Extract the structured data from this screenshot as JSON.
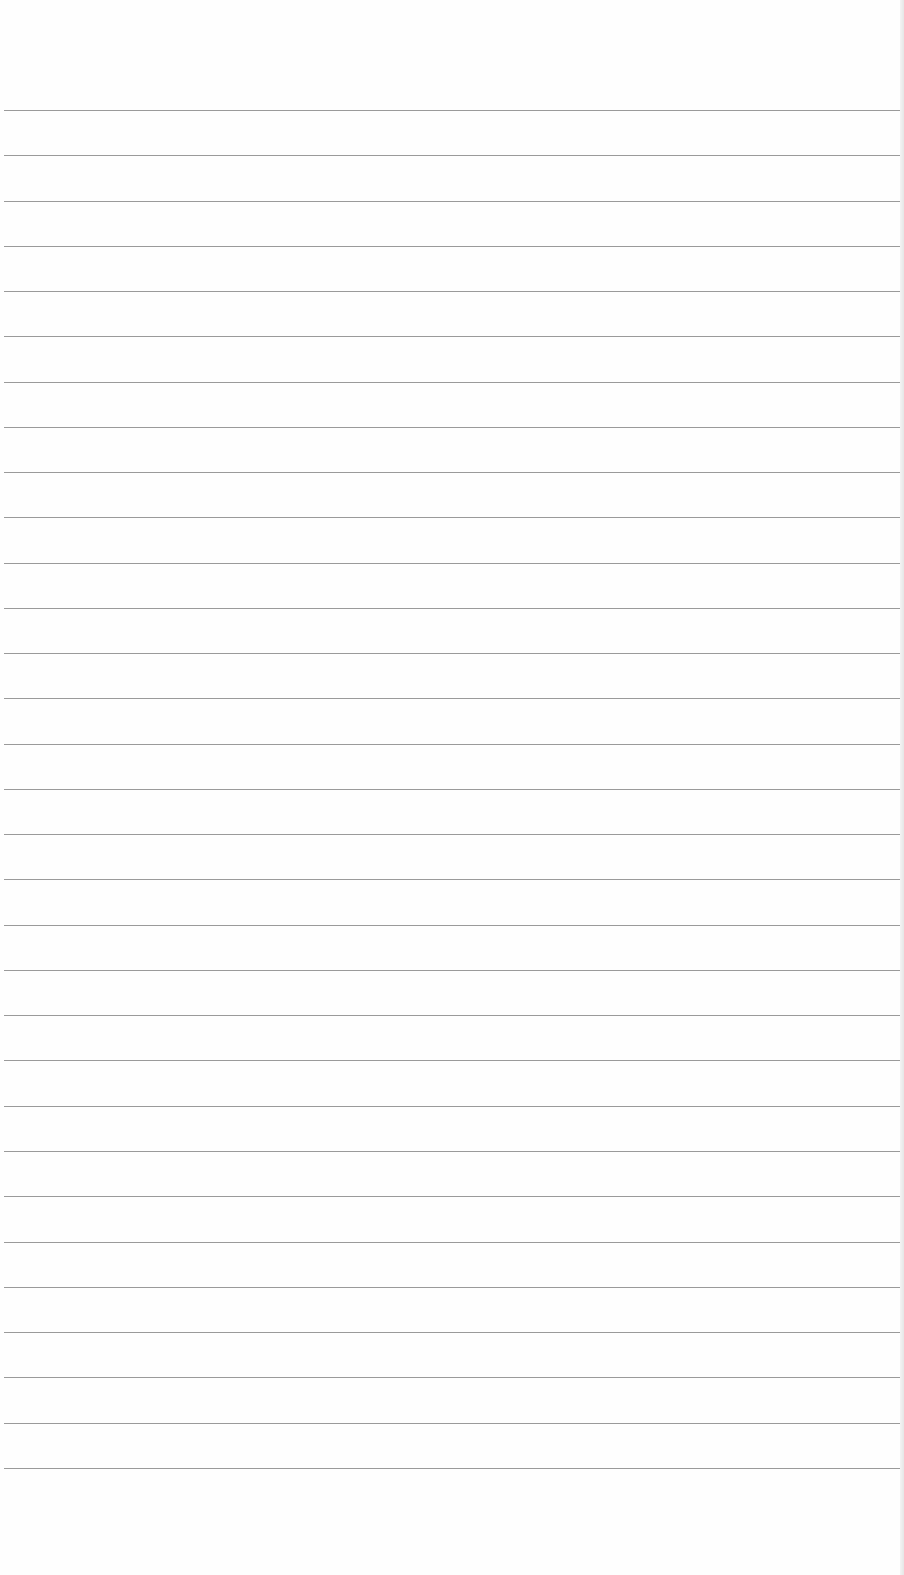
{
  "paper": {
    "type": "lined sheet",
    "line_count": 31,
    "first_line_y": 110,
    "line_spacing": 45.26,
    "line_color": "#9a9a9a",
    "background": "#fefefe"
  }
}
